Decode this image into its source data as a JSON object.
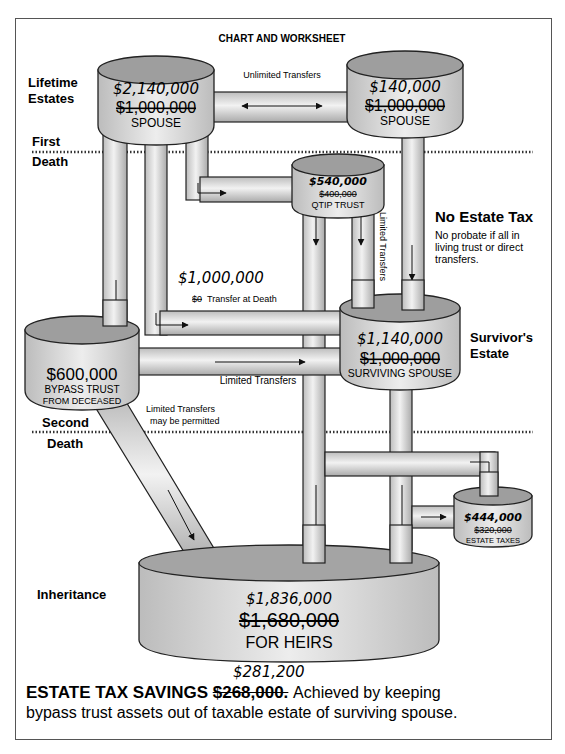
{
  "title": "CHART AND WORKSHEET",
  "sections": {
    "lifetime": [
      "Lifetime",
      "Estates"
    ],
    "first_death": [
      "First",
      "Death"
    ],
    "second_death": [
      "Second",
      "Death"
    ],
    "inheritance": "Inheritance",
    "survivors_estate": [
      "Survivor's",
      "Estate"
    ]
  },
  "tanks": {
    "spouse_left": {
      "new_value": "$2,140,000",
      "old_value": "$1,000,000",
      "label": "SPOUSE"
    },
    "spouse_right": {
      "new_value": "$140,000",
      "old_value": "$1,000,000",
      "label": "SPOUSE"
    },
    "qtip_trust": {
      "new_value": "$540,000",
      "old_value": "$400,000",
      "label": "QTIP TRUST"
    },
    "bypass_trust": {
      "value": "$600,000",
      "label_1": "BYPASS TRUST",
      "label_2": "FROM DECEASED"
    },
    "surviving_spouse": {
      "new_value": "$1,140,000",
      "old_value": "$1,000,000",
      "label": "SURVIVING SPOUSE"
    },
    "estate_taxes": {
      "new_value": "$444,000",
      "old_value": "$320,000",
      "label": "ESTATE TAXES"
    },
    "heirs": {
      "new_value": "$1,836,000",
      "old_value": "$1,680,000",
      "label": "FOR HEIRS"
    }
  },
  "pipes": {
    "unlimited_transfers": "Unlimited Transfers",
    "transfer_at_death_new": "$1,000,000",
    "transfer_at_death_old": "$0",
    "transfer_at_death_label": "Transfer at Death",
    "limited_transfers_bypass": "Limited Transfers",
    "limited_transfers_qtip": "Limited Transfers",
    "limited_permitted_1": "Limited Transfers",
    "limited_permitted_2": "may be permitted"
  },
  "no_estate_tax": {
    "heading": "No Estate Tax",
    "lines": [
      "No probate if all in",
      "living trust or direct",
      "transfers."
    ]
  },
  "footer": {
    "new_savings": "$281,200",
    "heading": "ESTATE TAX SAVINGS",
    "old_savings": "$268,000.",
    "line1_rest": "Achieved by keeping",
    "line2": "bypass trust assets out of taxable estate of surviving spouse."
  },
  "colors": {
    "tank_fill": "#d9d9d9",
    "tank_top": "#9a9a9a",
    "line": "#222222"
  }
}
